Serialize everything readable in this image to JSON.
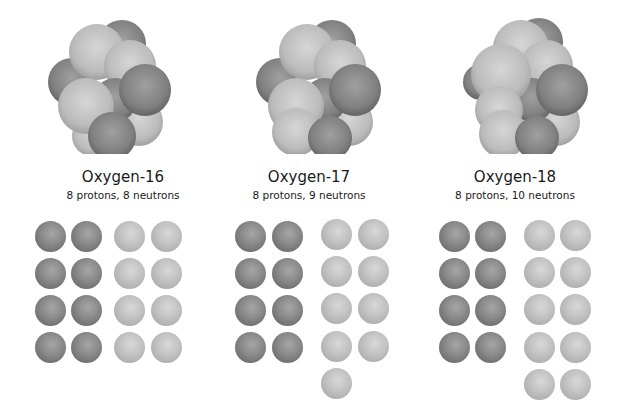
{
  "figure": {
    "colors": {
      "proton": "#7f7f7f",
      "neutron": "#bdbdbd",
      "background": "#ffffff"
    },
    "isotopes": [
      {
        "name": "Oxygen-16",
        "description": "8 protons, 8 neutrons",
        "protons": 8,
        "neutrons": 8
      },
      {
        "name": "Oxygen-17",
        "description": "8 protons, 9 neutrons",
        "protons": 8,
        "neutrons": 9
      },
      {
        "name": "Oxygen-18",
        "description": "8 protons, 10 neutrons",
        "protons": 8,
        "neutrons": 10
      }
    ]
  }
}
